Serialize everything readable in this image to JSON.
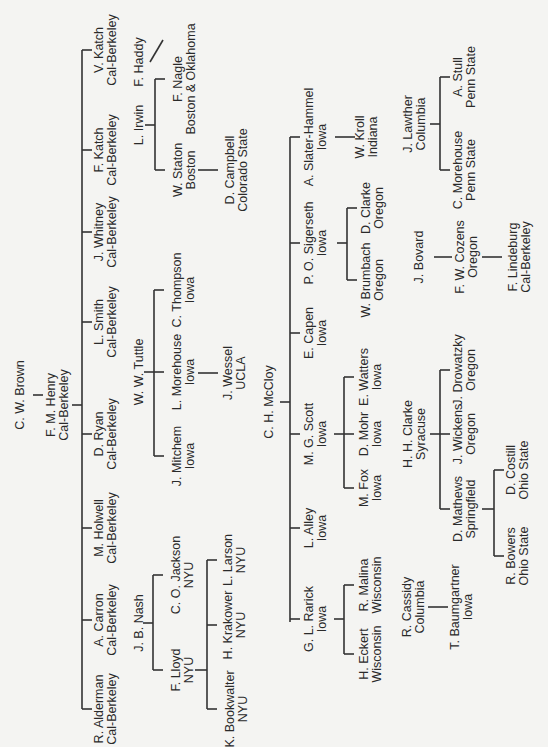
{
  "diagram": {
    "orientation": "rotated 90 degrees counter-clockwise",
    "nodes": [
      {
        "id": "cwbrown",
        "name": "C. W. Brown",
        "school": ""
      },
      {
        "id": "fmhenry",
        "name": "F. M. Henry",
        "school": "Cal-Berkeley"
      },
      {
        "id": "vkatch",
        "name": "V. Katch",
        "school": "Cal-Berkeley"
      },
      {
        "id": "fkatch",
        "name": "F. Katch",
        "school": "Cal-Berkeley"
      },
      {
        "id": "jwhitney",
        "name": "J. Whitney",
        "school": "Cal-Berkeley"
      },
      {
        "id": "lsmith",
        "name": "L. Smith",
        "school": "Cal-Berkeley"
      },
      {
        "id": "dryan",
        "name": "D. Ryan",
        "school": "Cal-Berkeley"
      },
      {
        "id": "mholwell",
        "name": "M. Holwell",
        "school": "Cal-Berkeley"
      },
      {
        "id": "acarron",
        "name": "A. Carron",
        "school": "Cal-Berkeley"
      },
      {
        "id": "ralderman",
        "name": "R. Alderman",
        "school": "Cal-Berkeley"
      },
      {
        "id": "lirwin",
        "name": "L. Irwin",
        "school": ""
      },
      {
        "id": "fhaddy",
        "name": "F. Haddy",
        "school": ""
      },
      {
        "id": "fnagle",
        "name": "F. Nagle",
        "school": "Boston & Oklahoma"
      },
      {
        "id": "wstaton",
        "name": "W. Staton",
        "school": "Boston"
      },
      {
        "id": "dcampbell",
        "name": "D. Campbell",
        "school": "Colorado State"
      },
      {
        "id": "wwtuttle",
        "name": "W. W. Tuttle",
        "school": ""
      },
      {
        "id": "cthompson",
        "name": "C. Thompson",
        "school": "Iowa"
      },
      {
        "id": "lmorehouse",
        "name": "L. Morehouse",
        "school": "Iowa"
      },
      {
        "id": "jmitchem",
        "name": "J. Mitchem",
        "school": "Iowa"
      },
      {
        "id": "jwessel",
        "name": "J. Wessel",
        "school": "UCLA"
      },
      {
        "id": "jbnash",
        "name": "J. B. Nash",
        "school": ""
      },
      {
        "id": "cojackson",
        "name": "C. O. Jackson",
        "school": "NYU"
      },
      {
        "id": "flloyd",
        "name": "F. Lloyd",
        "school": "NYU"
      },
      {
        "id": "llarson",
        "name": "L. Larson",
        "school": "NYU"
      },
      {
        "id": "hkrakower",
        "name": "H. Krakower",
        "school": "NYU"
      },
      {
        "id": "kbookwalter",
        "name": "K. Bookwalter",
        "school": "NYU"
      },
      {
        "id": "chmccloy",
        "name": "C. H. McCloy",
        "school": ""
      },
      {
        "id": "aslaterhammel",
        "name": "A. Slater-Hammel",
        "school": "Iowa"
      },
      {
        "id": "posigerseth",
        "name": "P. O. Sigerseth",
        "school": "Iowa"
      },
      {
        "id": "ecapen",
        "name": "E. Capen",
        "school": "Iowa"
      },
      {
        "id": "mgscott",
        "name": "M. G. Scott",
        "school": "Iowa"
      },
      {
        "id": "lalley",
        "name": "L. Alley",
        "school": "Iowa"
      },
      {
        "id": "glrarick",
        "name": "G. L. Rarick",
        "school": "Iowa"
      },
      {
        "id": "wkroll",
        "name": "W. Kroll",
        "school": "Indiana"
      },
      {
        "id": "dclarke",
        "name": "D. Clarke",
        "school": "Oregon"
      },
      {
        "id": "wbrumbach",
        "name": "W. Brumbach",
        "school": "Oregon"
      },
      {
        "id": "ewatters",
        "name": "E. Watters",
        "school": "Iowa"
      },
      {
        "id": "dmohr",
        "name": "D. Mohr",
        "school": "Iowa"
      },
      {
        "id": "mfox",
        "name": "M. Fox",
        "school": "Iowa"
      },
      {
        "id": "rmalina",
        "name": "R. Malina",
        "school": "Wisconsin"
      },
      {
        "id": "heckert",
        "name": "H. Eckert",
        "school": "Wisconsin"
      },
      {
        "id": "jlawther",
        "name": "J. Lawther",
        "school": "Columbia"
      },
      {
        "id": "astull",
        "name": "A. Stull",
        "school": "Penn State"
      },
      {
        "id": "cmorehouse",
        "name": "C. Morehouse",
        "school": "Penn State"
      },
      {
        "id": "jbovard",
        "name": "J. Bovard",
        "school": ""
      },
      {
        "id": "fwcozens",
        "name": "F. W. Cozens",
        "school": "Oregon"
      },
      {
        "id": "flindeburg",
        "name": "F. Lindeburg",
        "school": "Cal-Berkeley"
      },
      {
        "id": "hhclarke",
        "name": "H. H. Clarke",
        "school": "Syracuse"
      },
      {
        "id": "jdrowatzky",
        "name": "J. Drowatzky",
        "school": "Oregon"
      },
      {
        "id": "jwickens",
        "name": "J. Wickens",
        "school": "Oregon"
      },
      {
        "id": "dmathews",
        "name": "D. Mathews",
        "school": "Springfield"
      },
      {
        "id": "dcostill",
        "name": "D. Costill",
        "school": "Ohio State"
      },
      {
        "id": "rbowers",
        "name": "R. Bowers",
        "school": "Ohio State"
      },
      {
        "id": "rcassidy",
        "name": "R. Cassidy",
        "school": "Columbia"
      },
      {
        "id": "tbaumgartner",
        "name": "T. Baumgartner",
        "school": "Iowa"
      }
    ]
  }
}
